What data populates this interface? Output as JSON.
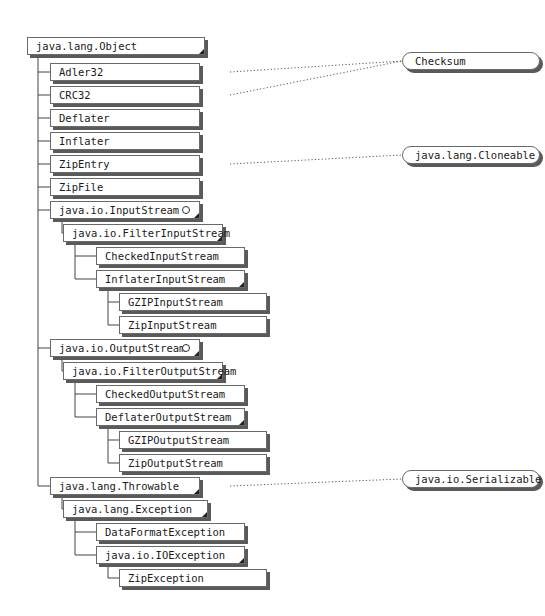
{
  "diagram": {
    "root": {
      "label": "java.lang.Object"
    },
    "classes": [
      {
        "id": "adler32",
        "label": "Adler32",
        "parent": "root",
        "implements": "checksum"
      },
      {
        "id": "crc32",
        "label": "CRC32",
        "parent": "root",
        "implements": "checksum"
      },
      {
        "id": "deflater",
        "label": "Deflater",
        "parent": "root"
      },
      {
        "id": "inflater",
        "label": "Inflater",
        "parent": "root"
      },
      {
        "id": "zipentry",
        "label": "ZipEntry",
        "parent": "root",
        "implements": "cloneable"
      },
      {
        "id": "zipfile",
        "label": "ZipFile",
        "parent": "root"
      },
      {
        "id": "inputstream",
        "label": "java.io.InputStream",
        "parent": "root",
        "abstract": true,
        "marker": "circle"
      },
      {
        "id": "filterinputstream",
        "label": "java.io.FilterInputStream",
        "parent": "inputstream",
        "abstract": true
      },
      {
        "id": "checkedinputstream",
        "label": "CheckedInputStream",
        "parent": "filterinputstream"
      },
      {
        "id": "inflaterinputstream",
        "label": "InflaterInputStream",
        "parent": "filterinputstream",
        "abstract": true
      },
      {
        "id": "gzipinputstream",
        "label": "GZIPInputStream",
        "parent": "inflaterinputstream"
      },
      {
        "id": "zipinputstream",
        "label": "ZipInputStream",
        "parent": "inflaterinputstream"
      },
      {
        "id": "outputstream",
        "label": "java.io.OutputStream",
        "parent": "root",
        "abstract": true,
        "marker": "circle"
      },
      {
        "id": "filteroutputstream",
        "label": "java.io.FilterOutputStream",
        "parent": "outputstream",
        "abstract": true
      },
      {
        "id": "checkedoutputstream",
        "label": "CheckedOutputStream",
        "parent": "filteroutputstream"
      },
      {
        "id": "deflateroutputstream",
        "label": "DeflaterOutputStream",
        "parent": "filteroutputstream",
        "abstract": true
      },
      {
        "id": "gzipoutputstream",
        "label": "GZIPOutputStream",
        "parent": "deflateroutputstream"
      },
      {
        "id": "zipoutputstream",
        "label": "ZipOutputStream",
        "parent": "deflateroutputstream"
      },
      {
        "id": "throwable",
        "label": "java.lang.Throwable",
        "parent": "root",
        "abstract": true,
        "implements": "serializable"
      },
      {
        "id": "exception",
        "label": "java.lang.Exception",
        "parent": "throwable",
        "abstract": true
      },
      {
        "id": "dataformatexception",
        "label": "DataFormatException",
        "parent": "exception"
      },
      {
        "id": "ioexception",
        "label": "java.io.IOException",
        "parent": "exception",
        "abstract": true
      },
      {
        "id": "zipexception",
        "label": "ZipException",
        "parent": "ioexception"
      }
    ],
    "interfaces": [
      {
        "id": "checksum",
        "label": "Checksum"
      },
      {
        "id": "cloneable",
        "label": "java.lang.Cloneable"
      },
      {
        "id": "serializable",
        "label": "java.io.Serializable"
      }
    ]
  }
}
